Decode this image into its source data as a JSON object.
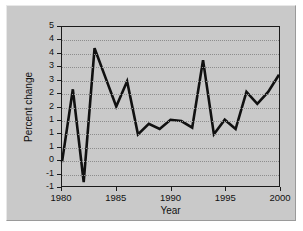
{
  "chart_data": {
    "type": "line",
    "title": "",
    "xlabel": "Year",
    "ylabel": "Percent change",
    "xlim": [
      1980,
      2000
    ],
    "ylim": [
      -1,
      5
    ],
    "grid": true,
    "legend": null,
    "xticks": [
      1980,
      1985,
      1990,
      1995,
      2000
    ],
    "xticklabels": [
      "1980",
      "1985",
      "1990",
      "1995",
      "2000"
    ],
    "yticks": [
      -1,
      -0.5,
      0,
      0.5,
      1,
      1.5,
      2,
      2.5,
      3,
      3.5,
      4,
      4.5,
      5
    ],
    "yticklabels": [
      "-1",
      "-1",
      "0",
      "1",
      "1",
      "1",
      "2",
      "2",
      "3",
      "3",
      "4",
      "4",
      "5"
    ],
    "series_name": "Percent change",
    "line_color": "#111111",
    "x": [
      1980,
      1981,
      1982,
      1983,
      1984,
      1985,
      1986,
      1987,
      1988,
      1989,
      1990,
      1991,
      1992,
      1993,
      1994,
      1995,
      1996,
      1997,
      1998,
      1999,
      2000
    ],
    "values": [
      -0.1,
      2.65,
      -0.85,
      4.2,
      3.1,
      2.0,
      2.95,
      0.95,
      1.35,
      1.15,
      1.5,
      1.45,
      1.2,
      3.75,
      0.95,
      1.5,
      1.15,
      2.55,
      2.1,
      2.55,
      3.2
    ]
  },
  "figure": {
    "background_color": "#c9c9c9",
    "page_background": "#ffffff"
  }
}
